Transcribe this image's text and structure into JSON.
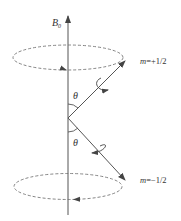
{
  "diagram": {
    "axis_label": "B",
    "axis_label_sub": "0",
    "angle_label_top": "θ",
    "angle_label_bottom": "θ",
    "state_top": {
      "m": "m",
      "value": "=+1/2"
    },
    "state_bottom": {
      "m": "m",
      "value": "=−1/2"
    },
    "colors": {
      "line": "#555555",
      "dashed": "#777777",
      "text": "#333333"
    }
  }
}
